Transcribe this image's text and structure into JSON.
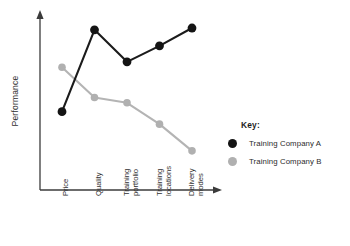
{
  "chart_data": {
    "type": "line",
    "title": "",
    "xlabel": "",
    "ylabel": "Performance",
    "categories": [
      "Price",
      "Quality",
      "Training portfolio",
      "Training locations",
      "Delivery modes"
    ],
    "category_lines": [
      [
        "Price"
      ],
      [
        "Quality"
      ],
      [
        "Training",
        "portfolio"
      ],
      [
        "Training",
        "locations"
      ],
      [
        "Delivery",
        "modes"
      ]
    ],
    "series": [
      {
        "name": "Training Company A",
        "color": "#141414",
        "values": [
          44,
          90,
          72,
          81,
          91
        ]
      },
      {
        "name": "Training Company B",
        "color": "#b0b0b0",
        "values": [
          69,
          52,
          49,
          37,
          22
        ]
      }
    ],
    "ylim": [
      0,
      100
    ],
    "y_ticks": [],
    "x_ticks_shown": true,
    "grid": false,
    "legend_position": "right",
    "axis_arrows": true,
    "axis_color": "#3b3b3b"
  },
  "legend": {
    "title": "Key:",
    "entries": [
      {
        "label": "Training Company A",
        "marker": "filled-circle-dark"
      },
      {
        "label": "Training Company B",
        "marker": "filled-circle-grey"
      }
    ]
  }
}
